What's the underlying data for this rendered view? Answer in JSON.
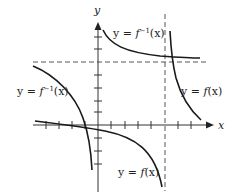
{
  "diagram": {
    "axes": {
      "x_label": "x",
      "y_label": "y"
    },
    "labels": {
      "finv_top": {
        "prefix": "y = ",
        "func": "f",
        "sup": "−1",
        "arg": "(x)"
      },
      "finv_left": {
        "prefix": "y = ",
        "func": "f",
        "sup": "−1",
        "arg": "(x)"
      },
      "f_right": {
        "prefix": "y = ",
        "func": "f",
        "arg": "(x)"
      },
      "f_bottom": {
        "prefix": "y = ",
        "func": "f",
        "arg": "(x)"
      }
    },
    "asymptotes": {
      "horizontal": "dashed",
      "vertical": "dashed"
    },
    "colors": {
      "curve": "#1a1a1a",
      "axis": "#333333",
      "dash": "#555555"
    }
  }
}
